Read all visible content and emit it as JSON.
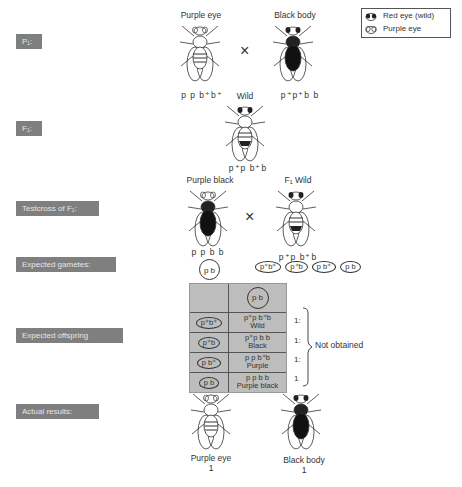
{
  "legend": {
    "items": [
      {
        "icon": "red-eye-icon",
        "label": "Red eye (wild)"
      },
      {
        "icon": "purple-eye-icon",
        "label": "Purple eye"
      }
    ]
  },
  "stages": {
    "p1": "P₁:",
    "f1": "F₁:",
    "testcross": "Testcross of F₁:",
    "gametes": "Expected gametes:",
    "offspring": "Expected offspring",
    "actual": "Actual results:"
  },
  "p1": {
    "left": {
      "caption": "Purple eye",
      "genotype": "p  p  b⁺b⁺"
    },
    "cross_symbol": "×",
    "right": {
      "caption": "Black body",
      "genotype": "p⁺p⁺b  b"
    }
  },
  "f1": {
    "caption": "Wild",
    "genotype": "p⁺p  b⁺b"
  },
  "testcross": {
    "left": {
      "caption": "Purple black",
      "genotype": "p  p  b  b"
    },
    "cross_symbol": "×",
    "right": {
      "caption": "F₁ Wild",
      "genotype": "p⁺p  b⁺b"
    }
  },
  "gametes": {
    "left": "p  b",
    "right": [
      "p⁺b⁺",
      "p⁺b",
      "p  b⁺",
      "p  b"
    ]
  },
  "punnett": {
    "header_gamete": "p  b",
    "rows": [
      {
        "gamete": "p⁺b⁺",
        "genotype": "p⁺p  b⁺b",
        "phenotype": "Wild",
        "ratio": "1:"
      },
      {
        "gamete": "p⁺b",
        "genotype": "p⁺p  b  b",
        "phenotype": "Black",
        "ratio": "1:"
      },
      {
        "gamete": "p  b⁺",
        "genotype": "p  p  b⁺b",
        "phenotype": "Purple",
        "ratio": "1:"
      },
      {
        "gamete": "p  b",
        "genotype": "p  p  b  b",
        "phenotype": "Purple black",
        "ratio": "1"
      }
    ],
    "note": "Not obtained"
  },
  "actual": {
    "left": {
      "caption": "Purple eye",
      "count": "1"
    },
    "right": {
      "caption": "Black body",
      "count": "1"
    }
  }
}
